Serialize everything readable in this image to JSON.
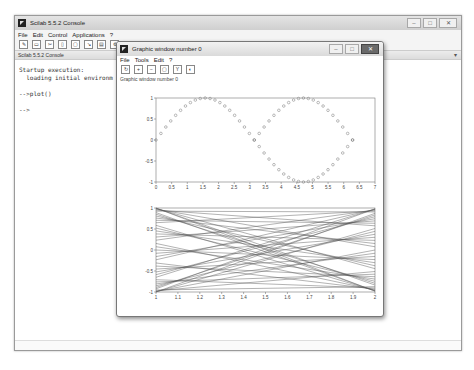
{
  "console": {
    "title": "Scilab 5.5.2 Console",
    "menu": [
      "File",
      "Edit",
      "Control",
      "Applications",
      "?"
    ],
    "toolbar_icons": [
      "new-script-icon",
      "open-file-icon",
      "cut-icon",
      "copy-icon",
      "paste-icon",
      "change-dir-icon",
      "print-icon",
      "preferences-icon",
      "help-icon"
    ],
    "tab_label": "Scilab 5.5.2 Console",
    "lines": [
      "Startup execution:",
      "  loading initial environm",
      "",
      "-->plot()",
      "",
      "-->"
    ],
    "window_buttons": {
      "minimize": "–",
      "maximize": "□",
      "close": "✕"
    }
  },
  "graphic_window": {
    "title": "Graphic window number 0",
    "menu": [
      "File",
      "Tools",
      "Edit",
      "?"
    ],
    "toolbar_icons": [
      "rotate-icon",
      "zoom-in-icon",
      "zoom-out-icon",
      "zoom-box-icon",
      "datatip-icon",
      "reset-view-icon"
    ],
    "label": "Graphic window number 0",
    "window_buttons": {
      "minimize": "–",
      "maximize": "□",
      "close": "✕"
    }
  },
  "chart_data": [
    {
      "type": "scatter",
      "title": "",
      "xlabel": "",
      "ylabel": "",
      "xlim": [
        0,
        7
      ],
      "ylim": [
        -1,
        1
      ],
      "xticks": [
        "0",
        "0.5",
        "1",
        "1.5",
        "2",
        "2.5",
        "3",
        "3.5",
        "4",
        "4.5",
        "5",
        "5.5",
        "6",
        "6.5",
        "7"
      ],
      "yticks": [
        "-1",
        "-0.5",
        "0",
        "0.5",
        "1"
      ],
      "series": [
        {
          "name": "sin(t)",
          "marker": "circle",
          "x_range": [
            0,
            6.28
          ],
          "points": 41
        },
        {
          "name": "abs(sin(t)) shifted",
          "marker": "circle",
          "x_range": [
            3.14,
            6.28
          ],
          "points": 21
        }
      ]
    },
    {
      "type": "line",
      "title": "",
      "xlabel": "",
      "ylabel": "",
      "xlim": [
        1,
        2
      ],
      "ylim": [
        -1,
        1
      ],
      "xticks": [
        "1",
        "1.1",
        "1.2",
        "1.3",
        "1.4",
        "1.5",
        "1.6",
        "1.7",
        "1.8",
        "1.9",
        "2"
      ],
      "yticks": [
        "-1",
        "-0.5",
        "0",
        "0.5",
        "1"
      ],
      "series_count": 41,
      "description": "Family of crossing straight lines from x=1 to x=2, pairing y(1)=k and y(2)=-k style, forming an hourglass envelope"
    }
  ]
}
